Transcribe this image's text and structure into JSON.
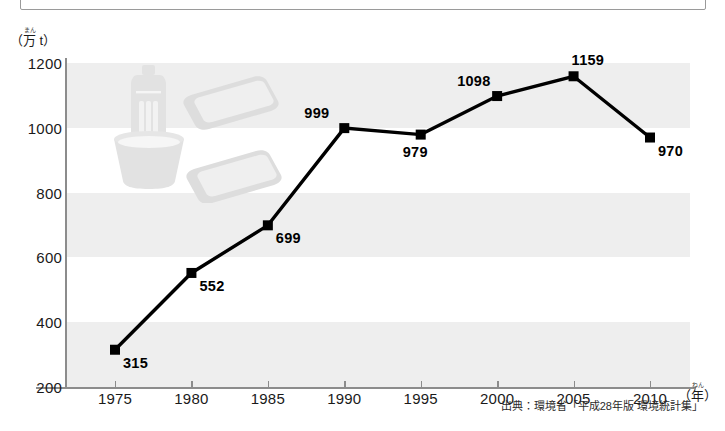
{
  "chart_data": {
    "type": "line",
    "title": "",
    "subtitle": "",
    "xlabel": "年",
    "ylabel": "万 t",
    "x": [
      1975,
      1980,
      1985,
      1990,
      1995,
      2000,
      2005,
      2010
    ],
    "categories": [
      "1975",
      "1980",
      "1985",
      "1990",
      "1995",
      "2000",
      "2005",
      "2010"
    ],
    "values": [
      315,
      552,
      699,
      999,
      979,
      1098,
      1159,
      970
    ],
    "point_labels": [
      "315",
      "552",
      "699",
      "999",
      "979",
      "1098",
      "1159",
      "970"
    ],
    "label_positions": [
      "below-right",
      "below-right",
      "below-right",
      "above-left",
      "below-left",
      "above-left",
      "above-center",
      "below-right"
    ],
    "series": [
      {
        "name": "",
        "values": [
          315,
          552,
          699,
          999,
          979,
          1098,
          1159,
          970
        ]
      }
    ],
    "ylim": [
      200,
      1200
    ],
    "yticks": [
      1200,
      1000,
      800,
      600,
      400,
      200
    ],
    "ytick_labels": [
      "1200",
      "1000",
      "800",
      "600",
      "400",
      "200"
    ],
    "xlim": [
      1973.2,
      1911.8
    ],
    "xticks": [
      1975,
      1980,
      1985,
      1990,
      1995,
      2000,
      2005,
      2010
    ],
    "grid": false,
    "banded_background": true,
    "band_interval": 200,
    "legend": "none",
    "marker": "square",
    "line_color": "#000000",
    "marker_color": "#000000",
    "band_color": "#eeeeee",
    "plot_background": "#ffffff",
    "axis_color": "#8c8c8c"
  },
  "axis": {
    "y_unit_prefix": "（",
    "y_unit_kanji": "万",
    "y_unit_ruby": "まん",
    "y_unit_suffix": " t）",
    "x_unit_prefix": "（",
    "x_unit_kanji": "年",
    "x_unit_ruby": "ねん",
    "x_unit_suffix": "）"
  },
  "source": {
    "text": "出典：環境省「平成28年版 環境統計集」"
  },
  "artwork": {
    "items": [
      {
        "name": "pet-bottle-illustration"
      },
      {
        "name": "cup-container-illustration"
      },
      {
        "name": "food-tray-illustration-upper"
      },
      {
        "name": "food-tray-illustration-lower"
      }
    ]
  }
}
